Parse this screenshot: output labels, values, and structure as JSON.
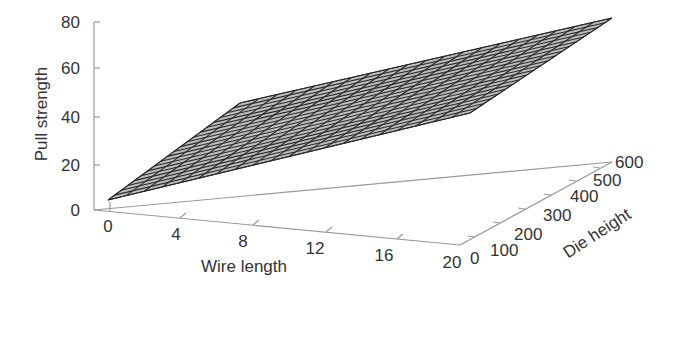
{
  "chart_data": {
    "type": "surface3d",
    "title": "",
    "xlabel": "Wire length",
    "ylabel": "Die height",
    "zlabel": "Pull strength",
    "x_ticks": [
      "0",
      "4",
      "8",
      "12",
      "16",
      "20"
    ],
    "y_ticks": [
      "0",
      "100",
      "200",
      "300",
      "400",
      "500",
      "600"
    ],
    "z_ticks": [
      "0",
      "20",
      "40",
      "60",
      "80"
    ],
    "xlim": [
      0,
      20
    ],
    "ylim": [
      0,
      600
    ],
    "zlim": [
      0,
      80
    ],
    "surface": {
      "description": "Planar regression surface of pull strength over wire length and die height",
      "corners": [
        {
          "wire_length": 0,
          "die_height": 0,
          "pull_strength": 2
        },
        {
          "wire_length": 20,
          "die_height": 0,
          "pull_strength": 56
        },
        {
          "wire_length": 0,
          "die_height": 600,
          "pull_strength": 10
        },
        {
          "wire_length": 20,
          "die_height": 600,
          "pull_strength": 64
        }
      ],
      "grid_lines": 20,
      "color": "#555555"
    },
    "grid": false,
    "legend": null
  },
  "colors": {
    "axis": "#9a9a9a",
    "surface_line": "#2a2a2a",
    "surface_fill": "#bdbdbd",
    "text": "#333333"
  }
}
